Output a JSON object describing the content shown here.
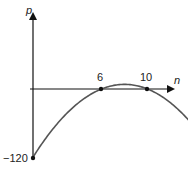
{
  "chart_data": {
    "type": "line",
    "title": "",
    "xlabel": "n",
    "ylabel": "p",
    "equation": "p = -2(n-6)(n-10)",
    "marked_points": [
      {
        "x": 0,
        "y": -120,
        "label": "−120"
      },
      {
        "x": 6,
        "y": 0,
        "label": "6"
      },
      {
        "x": 10,
        "y": 0,
        "label": "10"
      }
    ],
    "x": [
      0,
      1,
      2,
      3,
      4,
      5,
      6,
      7,
      8,
      9,
      10,
      11,
      12
    ],
    "series": [
      {
        "name": "p",
        "values": [
          -120,
          -90,
          -64,
          -42,
          -24,
          -10,
          0,
          6,
          8,
          6,
          0,
          -10,
          -24
        ]
      }
    ],
    "xlim": [
      0,
      12
    ],
    "ylim": [
      -120,
      25
    ],
    "grid": false
  },
  "labels": {
    "y_axis": "p",
    "x_axis": "n",
    "tick_6": "6",
    "tick_10": "10",
    "y_intercept": "−120"
  }
}
